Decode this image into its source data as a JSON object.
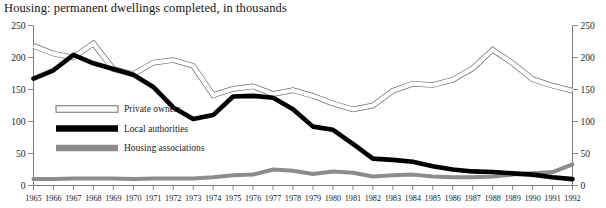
{
  "chart_data": {
    "type": "line",
    "title": "Housing: permanent dwellings completed, in thousands",
    "xlabel": "",
    "ylabel": "",
    "ylim": [
      0,
      250
    ],
    "yticks": [
      0,
      50,
      100,
      150,
      200,
      250
    ],
    "dual_axis": true,
    "right_axis_same_as_left": true,
    "grid": false,
    "legend_position": "inside-left",
    "x": [
      1965,
      1966,
      1967,
      1968,
      1969,
      1970,
      1971,
      1972,
      1973,
      1974,
      1975,
      1976,
      1977,
      1978,
      1979,
      1980,
      1981,
      1982,
      1983,
      1984,
      1985,
      1986,
      1987,
      1988,
      1989,
      1990,
      1991,
      1992
    ],
    "xticklabels": [
      "1965",
      "1966",
      "1967",
      "1968",
      "1969",
      "1970",
      "1971",
      "1972",
      "1973",
      "1974",
      "1975",
      "1976",
      "1977",
      "1978",
      "1979",
      "1980",
      "1981",
      "1982",
      "1983",
      "1984",
      "1985",
      "1986",
      "1987",
      "1988",
      "1989",
      "1990",
      "1991",
      "1992"
    ],
    "series": [
      {
        "name": "Private owners",
        "style": "hollow-white-outline",
        "color": "#ffffff",
        "edge_color": "#6e6e6e",
        "values": [
          218,
          206,
          200,
          222,
          182,
          174,
          192,
          196,
          187,
          141,
          151,
          155,
          143,
          149,
          140,
          128,
          119,
          125,
          148,
          159,
          157,
          165,
          183,
          212,
          191,
          166,
          156,
          148
        ]
      },
      {
        "name": "Local authorities",
        "style": "solid-black",
        "color": "#000000",
        "values": [
          167,
          180,
          204,
          191,
          182,
          173,
          154,
          122,
          104,
          110,
          139,
          140,
          137,
          119,
          92,
          87,
          65,
          42,
          40,
          37,
          30,
          25,
          22,
          21,
          19,
          17,
          13,
          10
        ]
      },
      {
        "name": "Housing associations",
        "style": "solid-grey",
        "color": "#8c8c8c",
        "values": [
          10,
          10,
          11,
          11,
          11,
          10,
          11,
          11,
          11,
          13,
          16,
          17,
          25,
          23,
          18,
          22,
          20,
          14,
          16,
          17,
          14,
          13,
          13,
          14,
          17,
          19,
          21,
          33
        ]
      }
    ]
  },
  "legend": {
    "items": [
      {
        "label": "Private owners"
      },
      {
        "label": "Local authorities"
      },
      {
        "label": "Housing associations"
      }
    ]
  }
}
